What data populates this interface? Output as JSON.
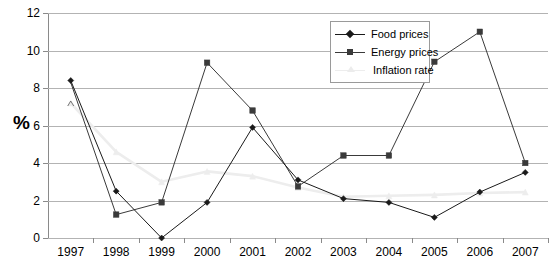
{
  "chart_data": {
    "type": "line",
    "title": "",
    "xlabel": "",
    "ylabel": "%",
    "ylim": [
      0,
      12
    ],
    "yticks": [
      0,
      2,
      4,
      6,
      8,
      10,
      12
    ],
    "grid": true,
    "legend_position": "upper-right",
    "categories": [
      "1997",
      "1998",
      "1999",
      "2000",
      "2001",
      "2002",
      "2003",
      "2004",
      "2005",
      "2006",
      "2007"
    ],
    "series": [
      {
        "name": "Food prices",
        "marker": "diamond",
        "color": "#1a1a1a",
        "values": [
          8.4,
          2.5,
          0.0,
          1.9,
          5.9,
          3.1,
          2.1,
          1.9,
          1.1,
          2.45,
          3.5
        ]
      },
      {
        "name": "Energy prices",
        "marker": "square",
        "color": "#3a3a3a",
        "values": [
          null,
          1.25,
          1.9,
          9.35,
          6.8,
          2.75,
          4.4,
          4.4,
          9.4,
          11.0,
          4.0
        ]
      },
      {
        "name": "Inflation rate",
        "marker": "triangle",
        "color": "#ededed",
        "values": [
          7.2,
          4.6,
          3.0,
          3.55,
          3.3,
          2.7,
          2.2,
          2.25,
          2.3,
          2.4,
          2.45
        ]
      }
    ]
  },
  "axis": {
    "y_title": "%",
    "y_tick_labels": [
      "12",
      "10",
      "8",
      "6",
      "4",
      "2",
      "0"
    ],
    "x_tick_labels": [
      "1997",
      "1998",
      "1999",
      "2000",
      "2001",
      "2002",
      "2003",
      "2004",
      "2005",
      "2006",
      "2007"
    ]
  },
  "legend": {
    "items": [
      {
        "label": "Food prices"
      },
      {
        "label": "Energy prices"
      },
      {
        "label": "Inflation rate"
      }
    ]
  }
}
